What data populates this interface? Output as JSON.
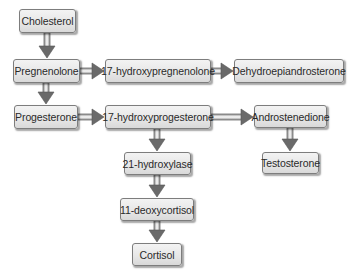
{
  "diagram": {
    "type": "flowchart",
    "colors": {
      "node_fill_top": "#f3f3f3",
      "node_fill_bottom": "#d9d9d9",
      "node_border": "#7d7d7d",
      "arrow_fill": "#6e6e6e",
      "text": "#2a2a2a",
      "background": "#ffffff"
    },
    "nodes": [
      {
        "id": "cholesterol",
        "label": "Cholesterol"
      },
      {
        "id": "pregnenolone",
        "label": "Pregnenolone"
      },
      {
        "id": "hydroxypregnenolone",
        "label": "17-hydroxypregnenolone"
      },
      {
        "id": "dhea",
        "label": "Dehydroepiandrosterone"
      },
      {
        "id": "progesterone",
        "label": "Progesterone"
      },
      {
        "id": "hydroxyprogesterone",
        "label": "17-hydroxyprogesterone"
      },
      {
        "id": "androstenedione",
        "label": "Androstenedione"
      },
      {
        "id": "hydroxylase21",
        "label": "21-hydroxylase"
      },
      {
        "id": "testosterone",
        "label": "Testosterone"
      },
      {
        "id": "deoxycortisol",
        "label": "11-deoxycortisol"
      },
      {
        "id": "cortisol",
        "label": "Cortisol"
      }
    ],
    "edges": [
      {
        "from": "cholesterol",
        "to": "pregnenolone"
      },
      {
        "from": "pregnenolone",
        "to": "hydroxypregnenolone"
      },
      {
        "from": "hydroxypregnenolone",
        "to": "dhea"
      },
      {
        "from": "pregnenolone",
        "to": "progesterone"
      },
      {
        "from": "progesterone",
        "to": "hydroxyprogesterone"
      },
      {
        "from": "hydroxyprogesterone",
        "to": "androstenedione"
      },
      {
        "from": "hydroxyprogesterone",
        "to": "hydroxylase21"
      },
      {
        "from": "androstenedione",
        "to": "testosterone"
      },
      {
        "from": "hydroxylase21",
        "to": "deoxycortisol"
      },
      {
        "from": "deoxycortisol",
        "to": "cortisol"
      }
    ]
  }
}
